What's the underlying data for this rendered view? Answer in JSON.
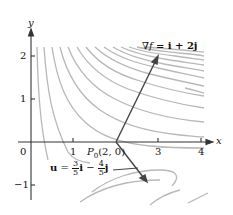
{
  "axes": {
    "x_label": "x",
    "y_label": "y",
    "x_ticks": [
      "0",
      "1",
      "3",
      "4"
    ],
    "y_ticks": [
      "2",
      "1",
      "−1"
    ]
  },
  "point": {
    "label": "P",
    "subscript": "0",
    "coords": "(2, 0)"
  },
  "gradient": {
    "nabla": "∇",
    "f": "f",
    "rhs": "= i + 2j"
  },
  "unit_vector": {
    "u": "u",
    "eq": "=",
    "frac1_num": "3",
    "frac1_den": "5",
    "i": "i",
    "minus": "−",
    "frac2_num": "4",
    "frac2_den": "5",
    "j": "j"
  },
  "colors": {
    "contour": "#b5b5b5",
    "axis": "#333333",
    "vector": "#444444"
  }
}
